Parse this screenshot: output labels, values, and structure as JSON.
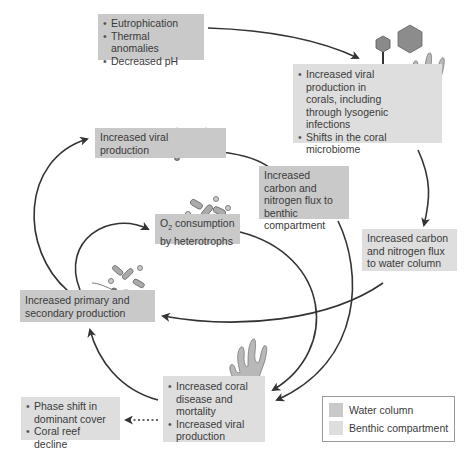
{
  "colors": {
    "water_column": "#c9c9c9",
    "benthic_compartment": "#dedede",
    "arrow": "#333333"
  },
  "boxes": {
    "drivers": {
      "type": "water",
      "items": [
        "Eutrophication",
        "Thermal anomalies",
        "Decreased pH"
      ]
    },
    "coral_response": {
      "type": "benthic",
      "items": [
        "Increased viral production in corals, including through lysogenic infections",
        "Shifts in the coral microbiome"
      ]
    },
    "viral_production_water": {
      "type": "water",
      "text": "Increased viral production"
    },
    "flux_benthic": {
      "type": "water",
      "text": "Increased carbon and nitrogen flux to benthic compartment"
    },
    "flux_water": {
      "type": "benthic",
      "text": "Increased carbon and nitrogen flux to water column"
    },
    "o2_consumption": {
      "type": "water",
      "text_pre": "O",
      "text_sub": "2",
      "text_post": " consumption by heterotrophs"
    },
    "primary_secondary": {
      "type": "water",
      "text": "Increased primary and secondary production"
    },
    "coral_disease": {
      "type": "benthic",
      "items": [
        "Increased coral disease and mortality",
        "Increased viral production"
      ]
    },
    "outcome": {
      "type": "benthic",
      "items": [
        "Phase shift in dominant cover",
        "Coral reef decline"
      ]
    }
  },
  "legend": {
    "items": [
      {
        "label": "Water column",
        "color": "#c9c9c9"
      },
      {
        "label": "Benthic compartment",
        "color": "#dedede"
      }
    ]
  }
}
